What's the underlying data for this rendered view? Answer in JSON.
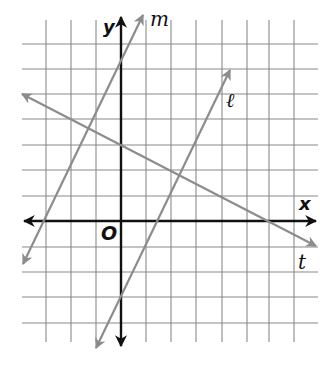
{
  "figure": {
    "type": "coordinate-plane",
    "axes": {
      "x_label": "x",
      "y_label": "y",
      "origin_label": "O"
    },
    "grid": {
      "x_min": -3,
      "x_max": 7,
      "y_min": -4,
      "y_max": 7,
      "unit_px": 25.2
    },
    "lines": [
      {
        "name": "m",
        "label": "m",
        "slope": 2,
        "intercept": 6,
        "color": "#8c8c8c"
      },
      {
        "name": "l",
        "label": "ℓ",
        "slope": 2,
        "intercept": -3,
        "color": "#8c8c8c"
      },
      {
        "name": "t",
        "label": "t",
        "slope": -0.5,
        "intercept": 3,
        "color": "#8c8c8c"
      }
    ]
  }
}
